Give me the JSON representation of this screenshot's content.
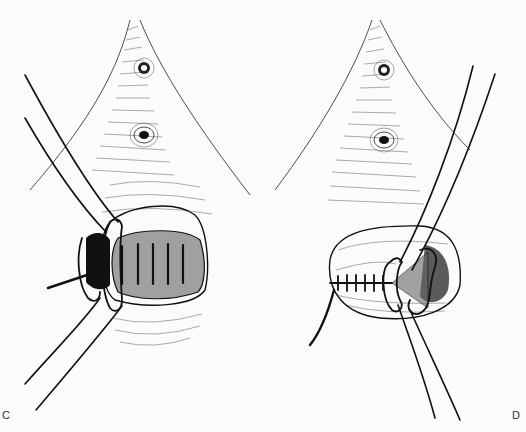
{
  "figure": {
    "panels": [
      {
        "label": "C",
        "view": "circumferential sutures placed across everted mucosa with traction tubes"
      },
      {
        "label": "D",
        "view": "mucosal closure partially completed with running transverse sutures and traction tubes"
      }
    ],
    "colors": {
      "ink": "#111111",
      "paper": "#fbfbfb"
    }
  }
}
